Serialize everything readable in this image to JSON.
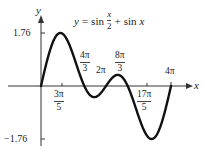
{
  "chart_data": {
    "type": "line",
    "equation": {
      "lhs": "y",
      "eq": "=",
      "fn1": "sin",
      "num": "x",
      "den": "2",
      "plus": "+",
      "fn2": "sin",
      "var": "x"
    },
    "xlabel": "x",
    "ylabel": "y",
    "xlim": [
      0,
      12.566
    ],
    "ylim": [
      -1.76,
      1.76
    ],
    "grid": false,
    "y_ticks": [
      {
        "label": "1.76",
        "value": 1.76
      },
      {
        "label": "−1.76",
        "value": -1.76
      }
    ],
    "x_ticks": [
      {
        "num": "3π",
        "den": "5",
        "value": 1.885,
        "position": "below"
      },
      {
        "num": "4π",
        "den": "3",
        "value": 4.189,
        "position": "above"
      },
      {
        "label": "2π",
        "value": 6.283,
        "position": "above"
      },
      {
        "num": "8π",
        "den": "3",
        "value": 8.378,
        "position": "above"
      },
      {
        "num": "17π",
        "den": "5",
        "value": 10.681,
        "position": "below"
      },
      {
        "label": "4π",
        "value": 12.566,
        "position": "above"
      }
    ],
    "series": [
      {
        "name": "y = sin(x/2) + sin(x)",
        "x": [
          0,
          1.885,
          4.189,
          5.2,
          6.283,
          7.1,
          8.378,
          10.681,
          12.566
        ],
        "values": [
          0,
          1.76,
          0,
          -0.37,
          0,
          0.37,
          0,
          -1.76,
          0
        ]
      }
    ],
    "colors": {
      "curve": "#111111",
      "axis": "#333333"
    }
  }
}
